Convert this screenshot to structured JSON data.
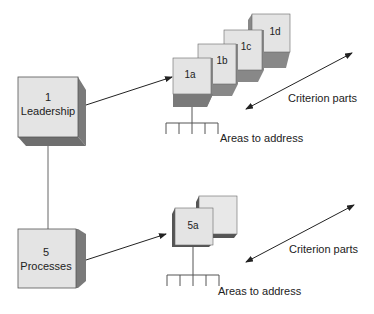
{
  "diagram": {
    "top_group": {
      "criterion_box": {
        "number": "1",
        "name": "Leadership"
      },
      "parts": [
        "1a",
        "1b",
        "1c",
        "1d"
      ],
      "criterion_parts_label": "Criterion parts",
      "areas_label": "Areas to address"
    },
    "bottom_group": {
      "criterion_box": {
        "number": "5",
        "name": "Processes"
      },
      "parts": [
        "5a"
      ],
      "criterion_parts_label": "Criterion parts",
      "areas_label": "Areas to address"
    },
    "colors": {
      "face": "#e6e6e6",
      "side": "#7a7a7a",
      "bottom": "#8c8c8c",
      "line": "#333333"
    }
  }
}
